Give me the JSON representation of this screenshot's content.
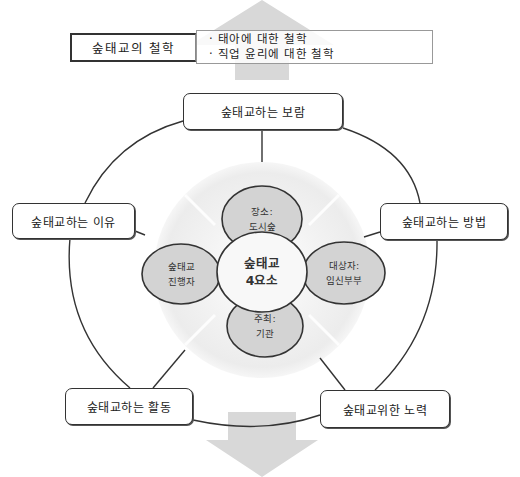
{
  "philosophy": {
    "label": "숲태교의 철학",
    "items": [
      "태아에 대한 철학",
      "직업 윤리에 대한 철학"
    ]
  },
  "outer_nodes": {
    "top": "숲태교하는 보람",
    "left": "숲태교하는 이유",
    "right": "숲태교하는 방법",
    "bottom_left": "숲태교하는 활동",
    "bottom_right": "숲태교위한 노력"
  },
  "center": {
    "line1": "숲태교",
    "line2": "4요소"
  },
  "elements": {
    "top": {
      "line1": "장소:",
      "line2": "도시숲"
    },
    "left": {
      "line1": "숲태교",
      "line2": "진행자"
    },
    "right": {
      "line1": "대상자:",
      "line2": "임신부부"
    },
    "bottom": {
      "line1": "주최:",
      "line2": "기관"
    }
  },
  "colors": {
    "arrow": "#d6d6d6",
    "disc": "#efefef",
    "element_fill": "#d3d3d3",
    "center_fill": "#f7f7f7",
    "line": "#333333"
  }
}
